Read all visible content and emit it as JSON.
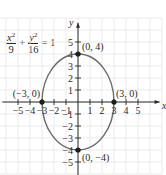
{
  "chart_data": {
    "type": "line",
    "title": "",
    "equation": {
      "term1": {
        "var": "x",
        "exp": "2",
        "den": "9"
      },
      "plus": "+",
      "term2": {
        "var": "y",
        "exp": "2",
        "den": "16"
      },
      "equals": "= 1"
    },
    "xlabel": "x",
    "ylabel": "y",
    "xlim": [
      -6,
      7
    ],
    "ylim": [
      -6,
      7
    ],
    "grid": true,
    "x_ticks": [
      -5,
      -4,
      -3,
      -2,
      -1,
      1,
      2,
      3,
      4,
      5
    ],
    "y_ticks": [
      -5,
      -4,
      -3,
      -2,
      -1,
      1,
      2,
      3,
      4,
      5
    ],
    "x_tick_labels": [
      "−5",
      "−4",
      "−3",
      "−2",
      "−1",
      "1",
      "2",
      "3",
      "4",
      "5"
    ],
    "y_tick_labels": [
      "−5",
      "−4",
      "−3",
      "−2",
      "−1",
      "1",
      "2",
      "3",
      "4",
      "5"
    ],
    "series": [
      {
        "name": "ellipse",
        "kind": "ellipse",
        "center": [
          0,
          0
        ],
        "a": 3,
        "b": 4
      }
    ],
    "points": [
      {
        "x": 0,
        "y": 4,
        "label": "(0, 4)",
        "label_pos": "right-above"
      },
      {
        "x": 0,
        "y": -4,
        "label": "(0, −4)",
        "label_pos": "right-below"
      },
      {
        "x": -3,
        "y": 0,
        "label": "(−3, 0)",
        "label_pos": "above-left"
      },
      {
        "x": 3,
        "y": 0,
        "label": "(3, 0)",
        "label_pos": "above-right"
      }
    ],
    "colors": {
      "curve": "#6b6b6b",
      "axes": "#2a2a2a",
      "grid": "#e6e6e6",
      "points": "#1e1e1e"
    }
  }
}
